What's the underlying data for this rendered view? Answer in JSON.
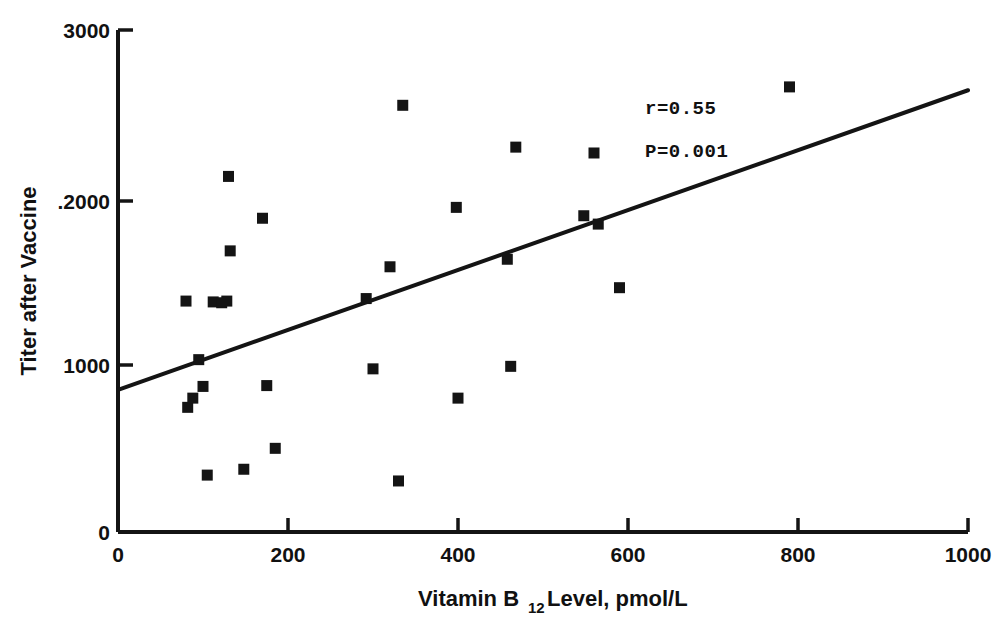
{
  "chart_data": {
    "type": "scatter",
    "title": "",
    "xlabel": "Vitamin B12 Level, pmol/L",
    "xlabel_main": "Vitamin B",
    "xlabel_sub": "12",
    "xlabel_tail": " Level, pmol/L",
    "ylabel": "Titer after Vaccine",
    "xlim": [
      0,
      1000
    ],
    "ylim": [
      0,
      3000
    ],
    "xticks": [
      0,
      200,
      400,
      600,
      800,
      1000
    ],
    "xtick_labels": [
      "0",
      "200",
      "400",
      "600",
      "800",
      "1000"
    ],
    "yticks": [
      0,
      1000,
      2000,
      3000
    ],
    "ytick_labels": [
      "0",
      "1000",
      ".2000",
      "3000"
    ],
    "grid": false,
    "legend": null,
    "marker": "square",
    "marker_color": "#141414",
    "points": [
      {
        "x": 80,
        "y": 1380
      },
      {
        "x": 82,
        "y": 745
      },
      {
        "x": 88,
        "y": 800
      },
      {
        "x": 95,
        "y": 1030
      },
      {
        "x": 100,
        "y": 870
      },
      {
        "x": 105,
        "y": 340
      },
      {
        "x": 112,
        "y": 1375
      },
      {
        "x": 122,
        "y": 1370
      },
      {
        "x": 128,
        "y": 1380
      },
      {
        "x": 130,
        "y": 2125
      },
      {
        "x": 132,
        "y": 1680
      },
      {
        "x": 148,
        "y": 375
      },
      {
        "x": 170,
        "y": 1875
      },
      {
        "x": 175,
        "y": 875
      },
      {
        "x": 185,
        "y": 500
      },
      {
        "x": 292,
        "y": 1395
      },
      {
        "x": 300,
        "y": 975
      },
      {
        "x": 320,
        "y": 1585
      },
      {
        "x": 330,
        "y": 305
      },
      {
        "x": 335,
        "y": 2550
      },
      {
        "x": 398,
        "y": 1940
      },
      {
        "x": 400,
        "y": 800
      },
      {
        "x": 458,
        "y": 1630
      },
      {
        "x": 462,
        "y": 990
      },
      {
        "x": 468,
        "y": 2300
      },
      {
        "x": 548,
        "y": 1890
      },
      {
        "x": 560,
        "y": 2265
      },
      {
        "x": 565,
        "y": 1840
      },
      {
        "x": 590,
        "y": 1460
      },
      {
        "x": 790,
        "y": 2660
      }
    ],
    "trend_line": {
      "x0": 0,
      "y0": 850,
      "x1": 1000,
      "y1": 2640
    },
    "annotations": [
      {
        "name": "correlation",
        "text": "r=0.55",
        "x": 620,
        "y": 2500
      },
      {
        "name": "p-value",
        "text": "P=0.001",
        "x": 620,
        "y": 2240
      }
    ]
  }
}
